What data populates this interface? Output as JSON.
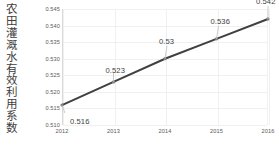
{
  "chart_data": {
    "type": "line",
    "title": "",
    "ylabel": "农田灌溉水有效利用系数",
    "xlabel": "",
    "categories": [
      "2012",
      "2013",
      "2014",
      "2015",
      "2016"
    ],
    "values": [
      0.516,
      0.523,
      0.53,
      0.536,
      0.542
    ],
    "data_labels": [
      "0.516",
      "0.523",
      "0.53",
      "0.536",
      "0.542"
    ],
    "ylim": [
      0.51,
      0.545
    ],
    "ytick_labels": [
      "0.510",
      "0.515",
      "0.520",
      "0.525",
      "0.530",
      "0.535",
      "0.540",
      "0.545"
    ],
    "ytick_values": [
      0.51,
      0.515,
      0.52,
      0.525,
      0.53,
      0.535,
      0.54,
      0.545
    ],
    "grid": true,
    "legend": "none",
    "series_color": "#404040",
    "marker_color": "#7f7f7f",
    "grid_color": "#f0f0f0",
    "axis_color": "#d9d9d9",
    "text_color": "#595959",
    "background": "#ffffff"
  }
}
